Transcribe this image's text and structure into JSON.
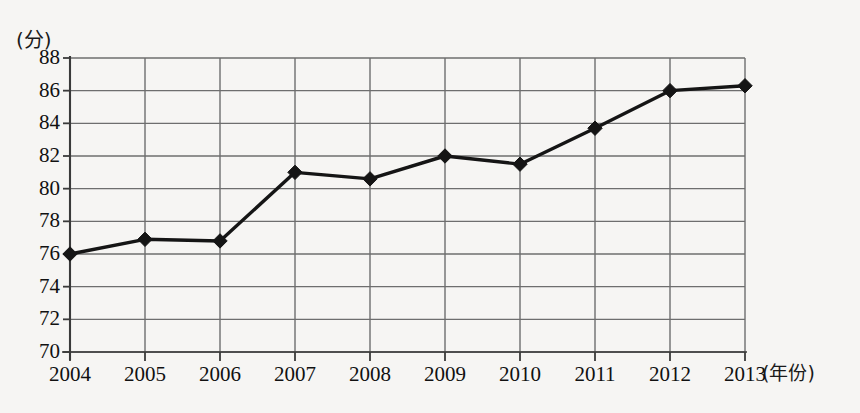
{
  "chart_data": {
    "type": "line",
    "title": "",
    "subtitle": "",
    "xlabel": "(年份)",
    "ylabel": "(分)",
    "categories": [
      "2004",
      "2005",
      "2006",
      "2007",
      "2008",
      "2009",
      "2010",
      "2011",
      "2012",
      "2013"
    ],
    "x": [
      2004,
      2005,
      2006,
      2007,
      2008,
      2009,
      2010,
      2011,
      2012,
      2013
    ],
    "values": [
      76.0,
      76.9,
      76.8,
      81.0,
      80.6,
      82.0,
      81.5,
      83.7,
      86.0,
      86.3
    ],
    "series": [
      {
        "name": "",
        "values": [
          76.0,
          76.9,
          76.8,
          81.0,
          80.6,
          82.0,
          81.5,
          83.7,
          86.0,
          86.3
        ]
      }
    ],
    "ylim": [
      70,
      88
    ],
    "xlim": [
      2004,
      2013
    ],
    "yticks": [
      70,
      72,
      74,
      76,
      78,
      80,
      82,
      84,
      86,
      88
    ],
    "ytick_labels": [
      "70",
      "72",
      "74",
      "76",
      "78",
      "80",
      "82",
      "84",
      "86",
      "88"
    ],
    "xtick_labels": [
      "2004",
      "2005",
      "2006",
      "2007",
      "2008",
      "2009",
      "2010",
      "2011",
      "2012",
      "2013"
    ],
    "grid": true,
    "grid_x": true,
    "grid_y": true,
    "legend": false,
    "legend_position": "none",
    "marker": "diamond",
    "line_color": "#151515",
    "grid_color": "#6e6e6e",
    "axis_color": "#3a3a3a",
    "background_color": "#f6f5f3",
    "annotations": []
  },
  "axes": {
    "y_unit": "(分)",
    "x_unit": "(年份)"
  }
}
